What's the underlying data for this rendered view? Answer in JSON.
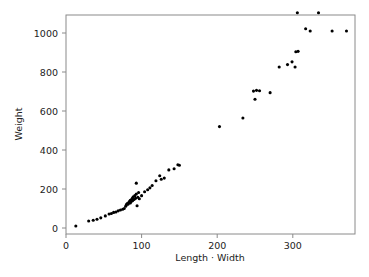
{
  "chart_data": {
    "type": "scatter",
    "title": "",
    "xlabel": "Length · Width",
    "ylabel": "Weight",
    "xlim": [
      0,
      382
    ],
    "ylim": [
      -30,
      1170
    ],
    "xticks": [
      0,
      100,
      200,
      300
    ],
    "xticklabels": [
      "0",
      "100",
      "200",
      "300"
    ],
    "yticks": [
      0,
      200,
      400,
      600,
      800,
      1000
    ],
    "yticklabels": [
      "0",
      "200",
      "400",
      "600",
      "800",
      "1000"
    ],
    "grid": false,
    "legend": null,
    "marker": "filled-circle",
    "marker_color": "#000000",
    "marker_size_px": 3.1,
    "n_points": 62,
    "points": [
      {
        "x": 13,
        "y": 10
      },
      {
        "x": 30,
        "y": 36
      },
      {
        "x": 36,
        "y": 40
      },
      {
        "x": 41,
        "y": 45
      },
      {
        "x": 46,
        "y": 52
      },
      {
        "x": 52,
        "y": 62
      },
      {
        "x": 57,
        "y": 72
      },
      {
        "x": 60,
        "y": 74
      },
      {
        "x": 63,
        "y": 80
      },
      {
        "x": 66,
        "y": 82
      },
      {
        "x": 69,
        "y": 88
      },
      {
        "x": 72,
        "y": 92
      },
      {
        "x": 75,
        "y": 96
      },
      {
        "x": 77,
        "y": 100
      },
      {
        "x": 79,
        "y": 112
      },
      {
        "x": 80,
        "y": 120
      },
      {
        "x": 81,
        "y": 126
      },
      {
        "x": 82,
        "y": 122
      },
      {
        "x": 83,
        "y": 130
      },
      {
        "x": 84,
        "y": 136
      },
      {
        "x": 85,
        "y": 128
      },
      {
        "x": 85,
        "y": 142
      },
      {
        "x": 86,
        "y": 134
      },
      {
        "x": 87,
        "y": 148
      },
      {
        "x": 88,
        "y": 140
      },
      {
        "x": 88,
        "y": 154
      },
      {
        "x": 89,
        "y": 160
      },
      {
        "x": 90,
        "y": 146
      },
      {
        "x": 91,
        "y": 166
      },
      {
        "x": 92,
        "y": 152
      },
      {
        "x": 93,
        "y": 230
      },
      {
        "x": 93,
        "y": 174
      },
      {
        "x": 94,
        "y": 114
      },
      {
        "x": 95,
        "y": 158
      },
      {
        "x": 96,
        "y": 182
      },
      {
        "x": 97,
        "y": 150
      },
      {
        "x": 100,
        "y": 166
      },
      {
        "x": 104,
        "y": 186
      },
      {
        "x": 108,
        "y": 196
      },
      {
        "x": 111,
        "y": 206
      },
      {
        "x": 114,
        "y": 218
      },
      {
        "x": 119,
        "y": 242
      },
      {
        "x": 124,
        "y": 268
      },
      {
        "x": 126,
        "y": 250
      },
      {
        "x": 130,
        "y": 256
      },
      {
        "x": 136,
        "y": 298
      },
      {
        "x": 143,
        "y": 304
      },
      {
        "x": 148,
        "y": 324
      },
      {
        "x": 150,
        "y": 322
      },
      {
        "x": 203,
        "y": 520
      },
      {
        "x": 234,
        "y": 564
      },
      {
        "x": 248,
        "y": 702
      },
      {
        "x": 250,
        "y": 660
      },
      {
        "x": 252,
        "y": 706
      },
      {
        "x": 256,
        "y": 704
      },
      {
        "x": 270,
        "y": 694
      },
      {
        "x": 282,
        "y": 826
      },
      {
        "x": 293,
        "y": 838
      },
      {
        "x": 299,
        "y": 852
      },
      {
        "x": 303,
        "y": 826
      },
      {
        "x": 304,
        "y": 904
      },
      {
        "x": 307,
        "y": 906
      },
      {
        "x": 306,
        "y": 1104
      },
      {
        "x": 317,
        "y": 1022
      },
      {
        "x": 323,
        "y": 1010
      },
      {
        "x": 334,
        "y": 1104
      },
      {
        "x": 352,
        "y": 1010
      },
      {
        "x": 371,
        "y": 1010
      }
    ]
  },
  "layout": {
    "plot_left_px": 66,
    "plot_right_px": 355,
    "plot_top_px": 15,
    "plot_bottom_px": 234,
    "x_zero_px": 66,
    "x_per_unit_px": 0.756,
    "y_zero_px": 228,
    "y_per_unit_px": 0.195
  }
}
